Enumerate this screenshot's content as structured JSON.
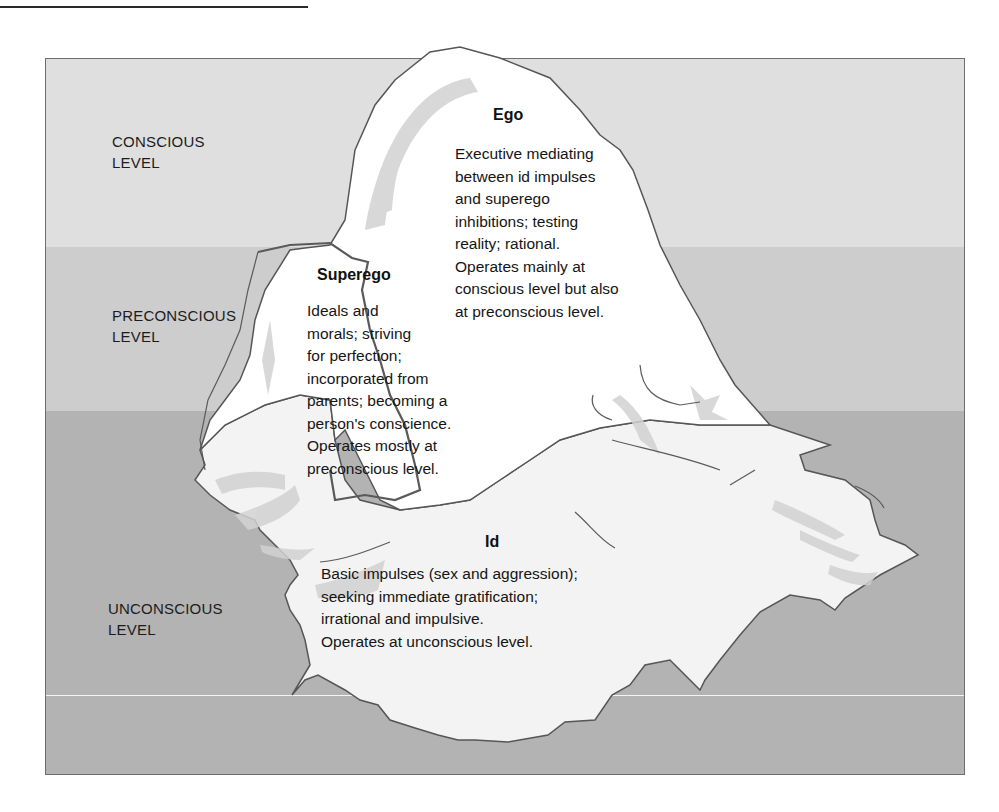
{
  "figure": {
    "colors": {
      "conscious_band": "#dfdfdf",
      "preconscious_band": "#cdcdcd",
      "unconscious_band": "#b3b3b3",
      "iceberg_fill": "#ffffff",
      "iceberg_submerged": "#f2f2f2",
      "outline": "#555555"
    }
  },
  "levels": [
    {
      "id": "conscious",
      "line1": "CONSCIOUS",
      "line2": "LEVEL"
    },
    {
      "id": "preconscious",
      "line1": "PRECONSCIOUS",
      "line2": "LEVEL"
    },
    {
      "id": "unconscious",
      "line1": "UNCONSCIOUS",
      "line2": "LEVEL"
    }
  ],
  "regions": {
    "ego": {
      "title": "Ego",
      "description": "Executive mediating\nbetween id impulses\nand superego\ninhibitions; testing\nreality; rational.\nOperates mainly at\nconscious level but also\nat preconscious level."
    },
    "superego": {
      "title": "Superego",
      "description": "Ideals and\nmorals; striving\nfor perfection;\nincorporated from\nparents; becoming a\nperson's conscience.\nOperates mostly at\npreconscious level."
    },
    "id": {
      "title": "Id",
      "description": "Basic impulses (sex and aggression);\nseeking immediate gratification;\nirrational and impulsive.\nOperates at unconscious level."
    }
  }
}
